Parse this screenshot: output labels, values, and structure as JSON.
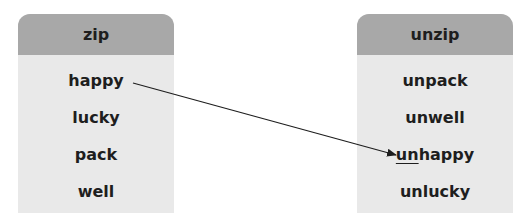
{
  "left": {
    "header": "zip",
    "items": [
      "happy",
      "lucky",
      "pack",
      "well"
    ]
  },
  "right": {
    "header": "unzip",
    "items": [
      {
        "prefix": "",
        "rest": "unpack"
      },
      {
        "prefix": "",
        "rest": "unwell"
      },
      {
        "prefix": "un",
        "rest": "happy"
      },
      {
        "prefix": "",
        "rest": "unlucky"
      }
    ]
  },
  "connection": {
    "from": "happy",
    "to": "unhappy"
  },
  "colors": {
    "header": "#a8a8a8",
    "body": "#e9e9e9",
    "text": "#1e1e1e"
  }
}
